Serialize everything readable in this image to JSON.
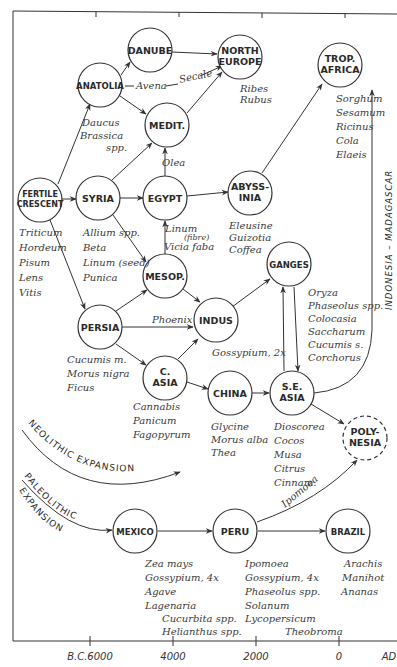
{
  "nodes": {
    "danube": {
      "label": [
        "DANUBE"
      ],
      "crops": []
    },
    "north_europe": {
      "label": [
        "NORTH",
        "EUROPE"
      ],
      "crops": [
        "Ribes",
        "Rubus"
      ]
    },
    "anatolia": {
      "label": [
        "ANATOLIA"
      ],
      "crops": [
        "Daucus",
        "Brassica",
        "spp."
      ]
    },
    "medit": {
      "label": [
        "MEDIT."
      ],
      "crops": [
        "Olea"
      ]
    },
    "trop_africa": {
      "label": [
        "TROP.",
        "AFRICA"
      ],
      "crops": [
        "Sorghum",
        "Sesamum",
        "Ricinus",
        "Cola",
        "Elaeis"
      ]
    },
    "fertile_crescent": {
      "label": [
        "FERTILE",
        "CRESCENT"
      ],
      "crops": [
        "Triticum",
        "Hordeum",
        "Pisum",
        "Lens",
        "Vitis"
      ]
    },
    "syria": {
      "label": [
        "SYRIA"
      ],
      "crops": [
        "Allium spp.",
        "Beta",
        "Linum (seed)",
        "Punica"
      ]
    },
    "egypt": {
      "label": [
        "EGYPT"
      ],
      "crops": [
        "Linum",
        "(fibre)",
        "Vicia faba"
      ]
    },
    "abyssinia": {
      "label": [
        "ABYSS-",
        "INIA"
      ],
      "crops": [
        "Eleusine",
        "Guizotia",
        "Coffea"
      ]
    },
    "ganges": {
      "label": [
        "GANGES"
      ],
      "crops": [
        "Oryza",
        "Phaseolus spp.",
        "Colocasia",
        "Saccharum",
        "Cucumis s.",
        "Corchorus"
      ]
    },
    "mesop": {
      "label": [
        "MESOP."
      ],
      "crops": []
    },
    "persia": {
      "label": [
        "PERSIA"
      ],
      "crops": [
        "Cucumis m.",
        "Morus nigra",
        "Ficus"
      ]
    },
    "indus": {
      "label": [
        "INDUS"
      ],
      "crops": [
        "Gossypium, 2x"
      ]
    },
    "c_asia": {
      "label": [
        "C.",
        "ASIA"
      ],
      "crops": [
        "Cannabis",
        "Panicum",
        "Fagopyrum"
      ]
    },
    "china": {
      "label": [
        "CHINA"
      ],
      "crops": [
        "Glycine",
        "Morus alba",
        "Thea"
      ]
    },
    "se_asia": {
      "label": [
        "S.E.",
        "ASIA"
      ],
      "crops": [
        "Dioscorea",
        "Cocos",
        "Musa",
        "Citrus",
        "Cinnam."
      ]
    },
    "polynesia": {
      "label": [
        "POLY-",
        "NESIA"
      ],
      "crops": []
    },
    "mexico": {
      "label": [
        "MEXICO"
      ],
      "crops": [
        "Zea mays",
        "Gossypium, 4x",
        "Agave",
        "Lagenaria",
        "Cucurbita spp.",
        "Helianthus spp."
      ]
    },
    "peru": {
      "label": [
        "PERU"
      ],
      "crops": [
        "Ipomoea",
        "Gossypium, 4x",
        "Phaseolus spp.",
        "Solanum",
        "Lycopersicum",
        "Theobroma"
      ]
    },
    "brazil": {
      "label": [
        "BRAZIL"
      ],
      "crops": [
        "Arachis",
        "Manihot",
        "Ananas"
      ]
    }
  },
  "edge_labels": {
    "avena": "Avena",
    "secale": "Secale",
    "phoenix": "Phoenix",
    "ipomoea": "Ipomoea",
    "indonesia_madagascar": "INDONESIA – MADAGASCAR"
  },
  "bands": {
    "neolithic": "NEOLITHIC EXPANSION",
    "paleolithic_1": "PALEOLITHIC",
    "paleolithic_2": "EXPANSION"
  },
  "axis": {
    "ticks": [
      "B.C.6000",
      "4000",
      "2000",
      "0",
      "AD"
    ]
  }
}
